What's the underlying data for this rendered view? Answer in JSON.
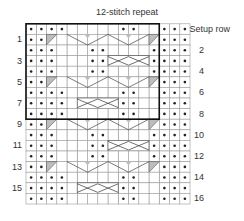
{
  "chart": {
    "title": "12-stitch repeat",
    "setup_label": "Setup row",
    "orientation": "rotated-180",
    "grid": {
      "columns": 16,
      "rows": 17,
      "repeat_columns": 12
    },
    "right_labels": [
      "Setup row",
      "2",
      "4",
      "6",
      "8",
      "10",
      "12",
      "14",
      "16"
    ],
    "left_labels": [
      "1",
      "3",
      "5",
      "7",
      "9",
      "11",
      "13",
      "15"
    ],
    "legend_symbols": {
      "dot": "purl",
      "blank": "knit",
      "cable": "cable cross",
      "triangle": "decrease/increase wedge"
    },
    "rows": [
      {
        "label": "Setup row",
        "cells": "DDD..DD.....DDDD"
      },
      {
        "label": "1",
        "cells": "DDDT.........TDDD"
      },
      {
        "label": "2",
        "cells": "DDDD....DD...DDD"
      },
      {
        "label": "3",
        "cells": "DDDDCCCCDD...DDD"
      },
      {
        "label": "4",
        "cells": "DDDD....DD...DDD"
      },
      {
        "label": "5",
        "cells": "DDDT.........TDDD"
      },
      {
        "label": "6",
        "cells": "DDD..DD.....DDDD"
      },
      {
        "label": "7",
        "cells": "DDD..DDCCCC.DDDD"
      },
      {
        "label": "8",
        "cells": "DDD..DD.....DDDD"
      },
      {
        "label": "9",
        "cells": "DDDT.........TDDD"
      },
      {
        "label": "10",
        "cells": "DDDD....DD...DDD"
      },
      {
        "label": "11",
        "cells": "DDDDCCCCDD...DDD"
      },
      {
        "label": "12",
        "cells": "DDDD....DD...DDD"
      },
      {
        "label": "13",
        "cells": "DDDT.........TDDD"
      },
      {
        "label": "14",
        "cells": "DDD..DD.....DDDD"
      },
      {
        "label": "15",
        "cells": "DDD..DDCCCC.DDDD"
      },
      {
        "label": "16",
        "cells": "DDD..DD.....DDDD"
      }
    ]
  }
}
